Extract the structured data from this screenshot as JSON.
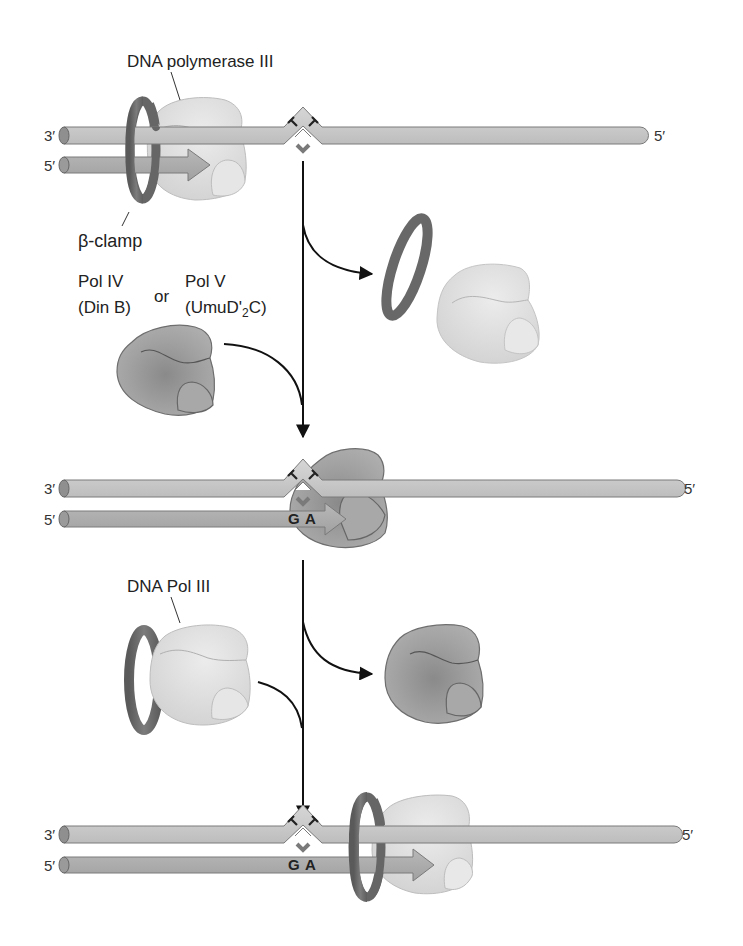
{
  "diagram": {
    "type": "translesion DNA synthesis schematic",
    "labels": {
      "pol3_full": "DNA polymerase III",
      "clamp": "β-clamp",
      "pol4_name": "Pol IV",
      "pol4_alias": "(Din B)",
      "or": "or",
      "pol5_name": "Pol V",
      "pol5_alias_pre": "(UmuD'",
      "pol5_alias_sub": "2",
      "pol5_alias_post": "C)",
      "pol3_short": "DNA Pol III"
    },
    "strand_ends": {
      "template_left": "3′",
      "template_right": "5′",
      "primer_left": "5′"
    },
    "lesion": {
      "name": "thymine dimer",
      "bases": [
        "T",
        "T"
      ]
    },
    "inserted_bases": {
      "first": "G",
      "second": "A"
    },
    "panels": [
      {
        "step": 1,
        "description": "DNA polymerase III with β-clamp stalled at thymine dimer"
      },
      {
        "step": 2,
        "description": "Pol IV or Pol V replaces Pol III and inserts G A opposite lesion"
      },
      {
        "step": 3,
        "description": "DNA Pol III with β-clamp resumes synthesis past the lesion"
      }
    ],
    "colors": {
      "template_strand": "#c8c8c8",
      "primer_strand": "#a9a9a9",
      "clamp": "#6e6e6e",
      "pol3": "#dcdcdc",
      "pol45": "#9a9a9a",
      "arrow": "#111111",
      "lesion_mark": "#7a7a7a"
    }
  }
}
